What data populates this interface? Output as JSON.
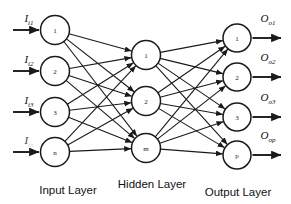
{
  "diagram": {
    "background_color": "#ffffff",
    "stroke_color": "#1a1a1a",
    "width": 291,
    "height": 204
  },
  "layers": [
    {
      "id": "input",
      "caption": "Input Layer",
      "caption_x": 68,
      "caption_y": 194,
      "node_x": 55,
      "node_radius": 14.5,
      "nodes": [
        {
          "label": "1",
          "cy": 30
        },
        {
          "label": "2",
          "cy": 71
        },
        {
          "label": "3",
          "cy": 112
        },
        {
          "label": "n",
          "cy": 152
        }
      ]
    },
    {
      "id": "hidden",
      "caption": "Hidden Layer",
      "caption_x": 152,
      "caption_y": 188,
      "node_x": 146,
      "node_radius": 14.5,
      "nodes": [
        {
          "label": "1",
          "cy": 55
        },
        {
          "label": "2",
          "cy": 101
        },
        {
          "label": "m",
          "cy": 148
        }
      ]
    },
    {
      "id": "output",
      "caption": "Output Layer",
      "caption_x": 238,
      "caption_y": 196,
      "node_x": 237,
      "node_radius": 14.0,
      "nodes": [
        {
          "label": "1",
          "cy": 38
        },
        {
          "label": "2",
          "cy": 77
        },
        {
          "label": "3",
          "cy": 117
        },
        {
          "label": "p",
          "cy": 155
        }
      ]
    }
  ],
  "input_signals": [
    {
      "base": "I",
      "sub": "i1",
      "label_x": 29,
      "label_y": 22,
      "arrow_y": 30,
      "faded": false
    },
    {
      "base": "I",
      "sub": "i2",
      "label_x": 29,
      "label_y": 63,
      "arrow_y": 71,
      "faded": false
    },
    {
      "base": "I",
      "sub": "i3",
      "label_x": 29,
      "label_y": 104,
      "arrow_y": 112,
      "faded": false
    },
    {
      "base": "I",
      "sub": "in",
      "label_x": 29,
      "label_y": 144,
      "arrow_y": 152,
      "faded": true
    }
  ],
  "output_signals": [
    {
      "base": "O",
      "sub": "o1",
      "label_x": 268,
      "label_y": 22,
      "arrow_y": 38
    },
    {
      "base": "O",
      "sub": "o2",
      "label_x": 268,
      "label_y": 61,
      "arrow_y": 77
    },
    {
      "base": "O",
      "sub": "o3",
      "label_x": 268,
      "label_y": 101,
      "arrow_y": 117
    },
    {
      "base": "O",
      "sub": "op",
      "label_x": 268,
      "label_y": 139,
      "arrow_y": 155
    }
  ],
  "connections": {
    "input_to_hidden": "fully-connected",
    "hidden_to_output": "fully-connected",
    "input_to_hidden_count": 12,
    "hidden_to_output_count": 12,
    "arrowheads": "target-end"
  }
}
